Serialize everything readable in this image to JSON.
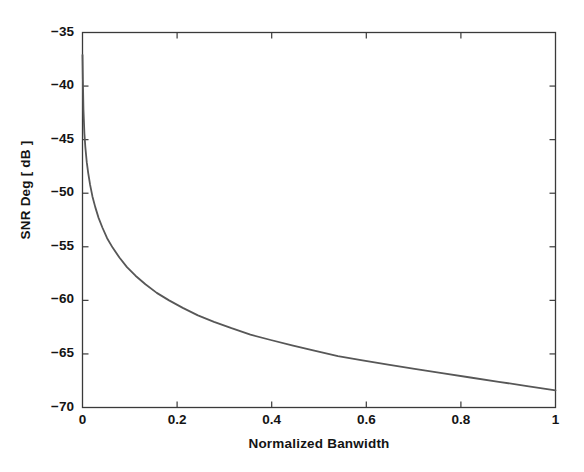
{
  "chart_data": {
    "type": "line",
    "title": "",
    "xlabel": "Normalized Banwidth",
    "ylabel": "SNR Deg [ dB ]",
    "xlim": [
      0,
      1
    ],
    "ylim": [
      -70,
      -35
    ],
    "xticks": [
      "0",
      "0.2",
      "0.4",
      "0.6",
      "0.8",
      "1"
    ],
    "xtick_values": [
      0,
      0.2,
      0.4,
      0.6,
      0.8,
      1
    ],
    "yticks": [
      "-35",
      "-40",
      "-45",
      "-50",
      "-55",
      "-60",
      "-65",
      "-70"
    ],
    "ytick_values": [
      -35,
      -40,
      -45,
      -50,
      -55,
      -60,
      -65,
      -70
    ],
    "grid": false,
    "legend": "none",
    "series": [
      {
        "name": "SNR Degradation",
        "color": "#575757",
        "line_width": 1.8,
        "x": [
          0.0,
          0.0008,
          0.002,
          0.004,
          0.006,
          0.009,
          0.012,
          0.016,
          0.021,
          0.027,
          0.034,
          0.042,
          0.052,
          0.064,
          0.078,
          0.094,
          0.112,
          0.133,
          0.157,
          0.183,
          0.212,
          0.244,
          0.278,
          0.315,
          0.355,
          0.398,
          0.443,
          0.49,
          0.54,
          0.592,
          0.646,
          0.702,
          0.76,
          0.82,
          0.88,
          0.94,
          1.0
        ],
        "y": [
          -37.1,
          -39.4,
          -42.2,
          -44.4,
          -45.7,
          -47.1,
          -48.1,
          -49.2,
          -50.3,
          -51.3,
          -52.3,
          -53.2,
          -54.2,
          -55.1,
          -56.0,
          -56.9,
          -57.7,
          -58.5,
          -59.3,
          -60.0,
          -60.7,
          -61.4,
          -62.0,
          -62.6,
          -63.2,
          -63.7,
          -64.2,
          -64.7,
          -65.2,
          -65.6,
          -66.0,
          -66.4,
          -66.8,
          -67.2,
          -67.6,
          -68.0,
          -68.4
        ]
      }
    ]
  },
  "axes": {
    "frame_color": "#3a3a3a",
    "background": "#ffffff"
  }
}
